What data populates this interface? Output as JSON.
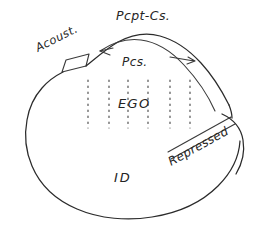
{
  "diagram": {
    "background_color": "#ffffff",
    "ink_color": "#2b2b2b",
    "labels": {
      "pcpt_cs": "Pcpt-Cs.",
      "acoust": "Acoust.",
      "pcs": "Pcs.",
      "ego": "EGO",
      "id": "ID",
      "repressed": "Repressed"
    },
    "regions": [
      {
        "name": "perceptual-conscious",
        "label": "Pcpt-Cs."
      },
      {
        "name": "acoustic-cap",
        "label": "Acoust."
      },
      {
        "name": "preconscious",
        "label": "Pcs."
      },
      {
        "name": "ego",
        "label": "EGO"
      },
      {
        "name": "id",
        "label": "ID"
      },
      {
        "name": "repressed",
        "label": "Repressed"
      }
    ],
    "dotted_column_count": 6
  }
}
